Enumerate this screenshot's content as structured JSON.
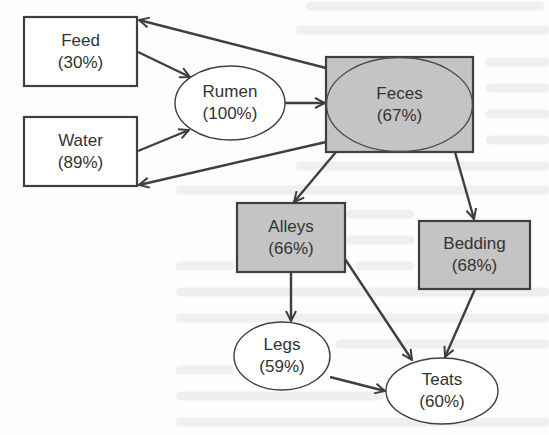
{
  "diagram": {
    "colors": {
      "stroke": "#3f3f3f",
      "shaded_fill": "#c4c4c4",
      "white_fill": "#ffffff",
      "text": "#333333",
      "background_bleed": "#ececec"
    },
    "nodes": [
      {
        "id": "feed",
        "name": "Feed",
        "value": "(30%)",
        "shape": "rect",
        "shaded": false
      },
      {
        "id": "water",
        "name": "Water",
        "value": "(89%)",
        "shape": "rect",
        "shaded": false
      },
      {
        "id": "rumen",
        "name": "Rumen",
        "value": "(100%)",
        "shape": "ellipse",
        "shaded": false
      },
      {
        "id": "feces",
        "name": "Feces",
        "value": "(67%)",
        "shape": "rect-with-ellipse",
        "shaded": true
      },
      {
        "id": "alleys",
        "name": "Alleys",
        "value": "(66%)",
        "shape": "rect",
        "shaded": true
      },
      {
        "id": "bedding",
        "name": "Bedding",
        "value": "(68%)",
        "shape": "rect",
        "shaded": true
      },
      {
        "id": "legs",
        "name": "Legs",
        "value": "(59%)",
        "shape": "ellipse",
        "shaded": false
      },
      {
        "id": "teats",
        "name": "Teats",
        "value": "(60%)",
        "shape": "ellipse",
        "shaded": false
      }
    ],
    "edges": [
      {
        "from": "feces",
        "to": "feed"
      },
      {
        "from": "feed",
        "to": "rumen"
      },
      {
        "from": "water",
        "to": "rumen"
      },
      {
        "from": "feces",
        "to": "water"
      },
      {
        "from": "rumen",
        "to": "feces"
      },
      {
        "from": "feces",
        "to": "alleys"
      },
      {
        "from": "feces",
        "to": "bedding"
      },
      {
        "from": "alleys",
        "to": "legs"
      },
      {
        "from": "alleys",
        "to": "teats"
      },
      {
        "from": "bedding",
        "to": "teats"
      },
      {
        "from": "legs",
        "to": "teats"
      }
    ]
  }
}
